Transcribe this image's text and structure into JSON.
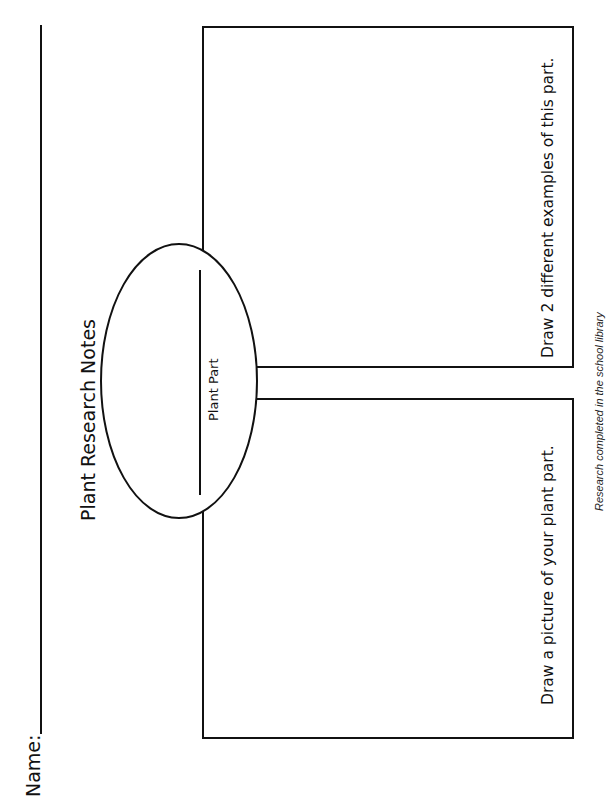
{
  "worksheet": {
    "orientation": "landscape-rotated-ccw",
    "name_field": {
      "label": "Name:",
      "value": ""
    },
    "title": "Plant Research Notes",
    "center_oval": {
      "label": "Plant Part",
      "answer_line_value": ""
    },
    "boxes": [
      {
        "id": "examples-box",
        "instruction": "Draw 2 different examples of this part."
      },
      {
        "id": "picture-box",
        "instruction": "Draw a picture of your plant part."
      }
    ],
    "footer": "Research completed in the school library"
  },
  "colors": {
    "ink": "#111111",
    "background": "#ffffff"
  }
}
